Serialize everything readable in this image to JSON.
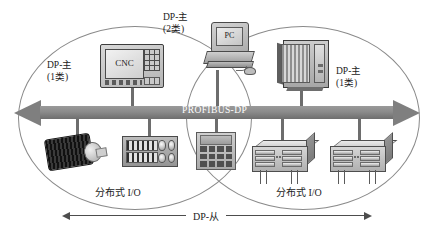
{
  "diagram": {
    "bus": {
      "label": "PROFIBUS-DP",
      "color": "#8b8b8b",
      "label_color": "#ffffff"
    },
    "masters": [
      {
        "id": "cnc",
        "label_line1": "DP-主",
        "label_line2": "(1类)",
        "device_text": "CNC"
      },
      {
        "id": "pc",
        "label_line1": "DP-主",
        "label_line2": "(2类)",
        "device_text": "PC"
      },
      {
        "id": "plc",
        "label_line1": "DP-主",
        "label_line2": "(1类)",
        "device_text": "PLC"
      }
    ],
    "zones": [
      {
        "id": "left-zone",
        "label": "分布式 I/O"
      },
      {
        "id": "right-zone",
        "label": "分布式 I/O"
      }
    ],
    "slave_scope": {
      "label": "DP-从"
    },
    "slaves": [
      {
        "id": "motor",
        "kind": "motor-drive"
      },
      {
        "id": "io-block",
        "kind": "terminal-io-module"
      },
      {
        "id": "hmi",
        "kind": "keypad-operator-panel"
      },
      {
        "id": "rack1",
        "kind": "distributed-io-rack"
      },
      {
        "id": "rack2",
        "kind": "distributed-io-rack"
      }
    ]
  }
}
